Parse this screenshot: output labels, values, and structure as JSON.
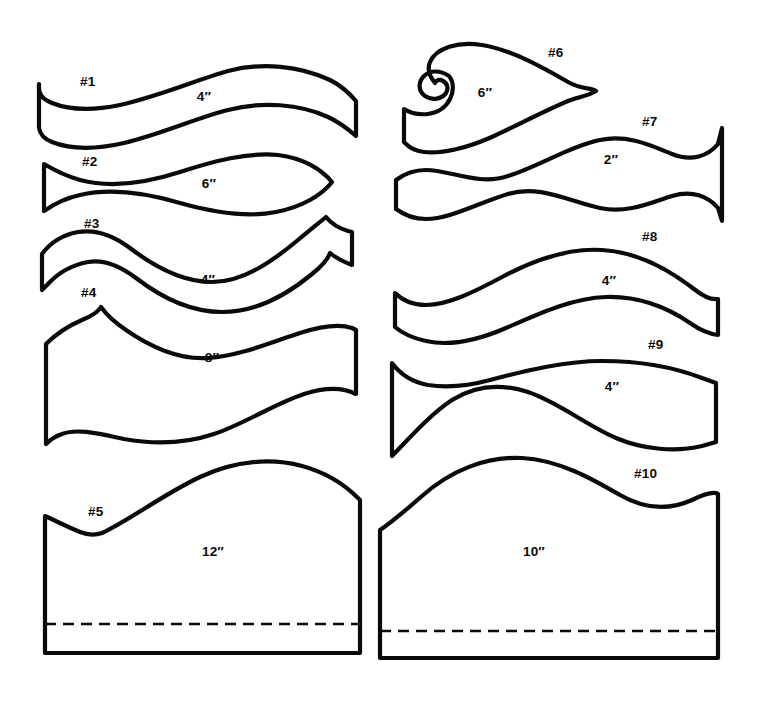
{
  "document": {
    "title": "Valance Pattern Templates",
    "background_color": "#ffffff",
    "ink_color": "#0a0a0a",
    "width": 760,
    "height": 702
  },
  "patterns": [
    {
      "id": "pattern-1",
      "number_label": "#1",
      "dimension_label": "4″",
      "column": "left",
      "has_hemline": false,
      "number_pos": {
        "x": 80,
        "y": 86
      },
      "dimension_pos": {
        "x": 204,
        "y": 101
      },
      "outline": "M 39 84 C 38 94 42 99 52 103 C 72 111 96 110 120 105 C 160 96 196 80 228 71 C 262 62 300 66 330 80 C 342 86 350 94 356 101 L 356 136 C 348 129 339 122 328 117 C 300 104 262 101 228 110 C 196 118 162 134 124 143 C 98 149 72 150 52 142 C 44 139 40 134 39 128 Z"
    },
    {
      "id": "pattern-2",
      "number_label": "#2",
      "dimension_label": "6″",
      "column": "left",
      "has_hemline": false,
      "number_pos": {
        "x": 82,
        "y": 166
      },
      "dimension_pos": {
        "x": 209,
        "y": 188
      },
      "outline": "M 44 164 C 54 170 66 176 80 180 C 110 188 146 183 180 172 C 214 161 248 152 278 155 C 304 158 322 170 332 182 C 322 195 302 207 276 212 C 246 218 212 212 180 203 C 146 193 110 188 80 195 C 66 198 54 204 44 211 Z"
    },
    {
      "id": "pattern-3",
      "number_label": "#3",
      "dimension_label": "4″",
      "column": "left",
      "has_hemline": false,
      "number_pos": {
        "x": 84,
        "y": 228
      },
      "dimension_pos": {
        "x": 208,
        "y": 284
      },
      "outline": "M 42 254 C 50 243 62 235 78 232 C 96 229 114 236 130 248 C 156 268 184 282 212 282 C 244 282 274 260 298 240 C 310 230 320 222 326 217 C 330 222 338 228 348 231 L 352 232 L 352 265 C 344 262 336 258 330 253 C 328 259 322 266 312 274 C 288 294 256 312 222 312 C 192 312 162 298 136 278 C 120 266 104 259 88 262 C 72 265 58 273 48 284 L 42 290 Z"
    },
    {
      "id": "pattern-4",
      "number_label": "#4",
      "dimension_label": "8″",
      "column": "left",
      "has_hemline": false,
      "number_pos": {
        "x": 81,
        "y": 297
      },
      "dimension_pos": {
        "x": 212,
        "y": 362
      },
      "outline": "M 46 344 C 56 334 68 326 82 320 C 92 316 98 312 101 307 C 106 314 114 322 126 330 C 152 348 180 360 208 358 C 240 356 272 342 300 333 C 322 326 340 324 352 328 L 356 330 L 356 394 C 344 388 326 387 304 394 C 274 404 244 424 214 434 C 184 444 152 444 124 439 C 100 434 78 428 62 434 C 56 436 50 440 46 444 Z"
    },
    {
      "id": "pattern-5",
      "number_label": "#5",
      "dimension_label": "12″",
      "column": "left",
      "has_hemline": true,
      "number_pos": {
        "x": 88,
        "y": 516
      },
      "dimension_pos": {
        "x": 213,
        "y": 556
      },
      "outline": "M 45 516 C 58 522 70 528 80 532 C 90 536 96 535 102 533 C 130 520 162 495 200 477 C 236 460 272 458 302 466 C 328 473 346 486 358 498 L 360 500 L 360 653 L 45 653 Z",
      "hemline": "M 45 624 L 360 624"
    },
    {
      "id": "pattern-6",
      "number_label": "#6",
      "dimension_label": "6″",
      "column": "right",
      "has_hemline": false,
      "number_pos": {
        "x": 548,
        "y": 57
      },
      "dimension_pos": {
        "x": 485,
        "y": 97
      },
      "outline": "M 449 76 C 440 70 430 70 424 76 C 418 82 418 91 425 96 C 432 101 442 99 446 93 C 449 88 447 83 443 81 C 440 79 436 80 435 83 C 430 77 427 69 430 62 C 436 48 458 41 482 45 C 512 50 544 68 568 82 C 582 90 590 87 596 91 C 588 96 578 97 568 101 C 542 112 516 126 494 136 C 468 148 442 154 424 152 C 416 151 410 148 406 144 L 404 142 L 404 109 C 410 113 418 115 428 114 C 438 113 446 107 450 99 C 454 91 454 82 449 76 Z"
    },
    {
      "id": "pattern-7",
      "number_label": "#7",
      "dimension_label": "2″",
      "column": "right",
      "has_hemline": false,
      "number_pos": {
        "x": 642,
        "y": 126
      },
      "dimension_pos": {
        "x": 611,
        "y": 164
      },
      "outline": "M 396 180 C 404 174 414 170 426 170 C 450 170 478 186 508 176 C 540 166 570 146 600 140 C 628 134 652 146 672 154 C 692 162 708 156 718 144 L 722 128 L 722 221 L 718 208 C 708 196 692 190 672 196 C 652 202 628 214 600 208 C 570 202 540 184 508 194 C 478 203 450 219 426 219 C 414 219 404 215 396 209 Z"
    },
    {
      "id": "pattern-8",
      "number_label": "#8",
      "dimension_label": "4″",
      "column": "right",
      "has_hemline": false,
      "number_pos": {
        "x": 642,
        "y": 241
      },
      "dimension_pos": {
        "x": 609,
        "y": 285
      },
      "outline": "M 395 293 C 402 300 412 305 426 305 C 448 305 474 292 504 276 C 536 259 570 248 602 250 C 640 252 672 272 694 289 C 704 297 712 300 718 299 L 718 335 C 710 334 700 330 690 323 C 668 308 640 296 606 297 C 572 298 538 314 506 328 C 476 341 448 346 426 341 C 412 338 402 333 395 327 Z"
    },
    {
      "id": "pattern-9",
      "number_label": "#9",
      "dimension_label": "4″",
      "column": "right",
      "has_hemline": false,
      "number_pos": {
        "x": 648,
        "y": 349
      },
      "dimension_pos": {
        "x": 612,
        "y": 391
      },
      "outline": "M 392 363 C 400 374 412 382 428 385 C 448 388 468 386 490 380 C 528 370 566 361 602 361 C 640 361 676 368 702 378 L 716 383 L 716 442 L 702 446 C 676 452 644 450 616 438 C 586 425 558 402 528 392 C 500 383 474 386 452 400 C 428 416 408 440 392 456 Z"
    },
    {
      "id": "pattern-10",
      "number_label": "#10",
      "dimension_label": "10″",
      "column": "right",
      "has_hemline": true,
      "number_pos": {
        "x": 634,
        "y": 478
      },
      "dimension_pos": {
        "x": 534,
        "y": 556
      },
      "outline": "M 380 530 C 392 522 406 510 422 496 C 450 471 486 456 522 458 C 560 460 594 480 620 495 C 646 510 670 510 692 500 C 702 495 710 492 716 493 L 718 494 L 718 658 L 380 658 Z",
      "hemline": "M 380 631 L 718 631"
    }
  ]
}
